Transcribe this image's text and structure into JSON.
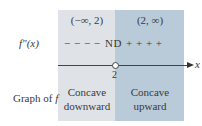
{
  "diagram": {
    "type": "sign-chart",
    "intervals": [
      {
        "label": "(−∞, 2)",
        "sign": "− − − −",
        "concavity_line1": "Concave",
        "concavity_line2": "downward",
        "fill": "#dfe3e7"
      },
      {
        "label": "(2, ∞)",
        "sign": "+ + + +",
        "concavity_line1": "Concave",
        "concavity_line2": "upward",
        "fill": "#b9cbd8"
      }
    ],
    "row_labels": {
      "derivative": "f″(x)",
      "graph_prefix": "Graph of ",
      "graph_func": "f"
    },
    "critical_point": {
      "value": "2",
      "marker": "open-circle",
      "sign_at_point": "ND"
    },
    "axis": {
      "variable": "x",
      "direction": "right-arrow"
    }
  }
}
